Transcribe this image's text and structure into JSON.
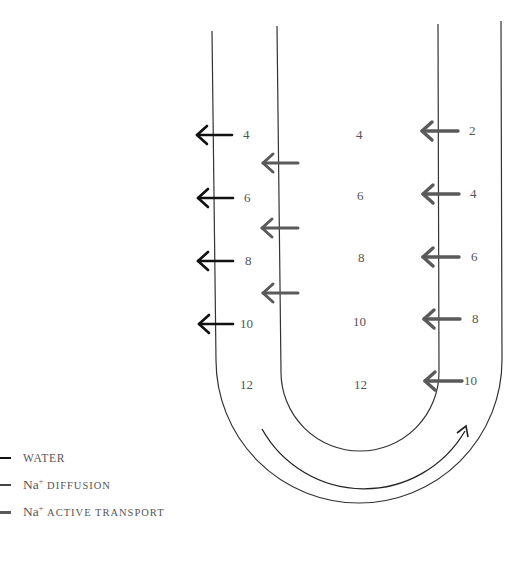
{
  "diagram": {
    "type": "loop-of-henle-countercurrent",
    "colors": {
      "water_arrow": "#111111",
      "na_diffusion_arrow": "#555555",
      "na_active_transport_arrow": "#5a5a5a",
      "tube_wall": "#333333",
      "number_text": "#555555"
    },
    "descending_limb_outside_labels": [
      "4",
      "6",
      "8",
      "10"
    ],
    "interstitium_labels": [
      "4",
      "6",
      "8",
      "10",
      "12"
    ],
    "descending_limb_bottom_label": "12",
    "ascending_limb_outside_labels": [
      "2",
      "4",
      "6",
      "8",
      "10"
    ],
    "arrows": {
      "water_count": 4,
      "na_diffusion_count": 3,
      "na_active_transport_count": 5
    },
    "flow_arrow": "curved-arrow-clockwise-around-bend"
  },
  "legend": {
    "items": [
      {
        "key": "water",
        "label": "WATER",
        "prefix": "",
        "sup": ""
      },
      {
        "key": "na_diffusion",
        "label": "DIFFUSION",
        "prefix": "Na",
        "sup": "+"
      },
      {
        "key": "na_active_transport",
        "label": "ACTIVE TRANSPORT",
        "prefix": "Na",
        "sup": "+"
      }
    ]
  }
}
